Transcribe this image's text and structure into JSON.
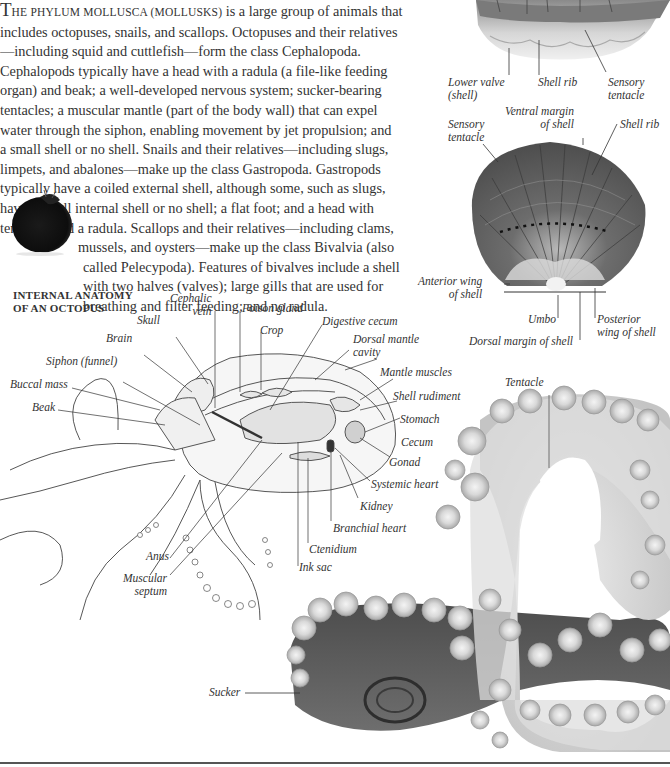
{
  "intro": {
    "lead_cap": "T",
    "lead_smallcaps": "HE PHYLUM MOLLUSCA (MOLLUSKS)",
    "lines": [
      " is a large group of animals that",
      "includes octopuses, snails, and scallops. Octopuses and their relatives",
      "—including squid and cuttlefish—form the class Cephalopoda.",
      "Cephalopods typically have a head with a radula (a file-like feeding",
      "organ) and beak; a well-developed nervous system; sucker-bearing",
      "tentacles; a muscular mantle (part of the body wall) that can expel",
      "water through the siphon, enabling movement by jet propulsion; and",
      "a small shell or no shell. Snails and their relatives—including slugs,",
      "limpets, and abalones—make up the class Gastropoda. Gastropods",
      "typically have a coiled external shell, although some, such as slugs,",
      "have a small internal shell or no shell; a flat foot; and a head with",
      "tentacles and a radula. Scallops and their relatives—including clams,"
    ],
    "indented_lines": [
      "mussels, and oysters—make up the class Bivalvia (also",
      "called Pelecypoda). Features of bivalves include a shell",
      "with two halves (valves); large gills that are used for",
      "breathing and filter feeding; and no radula."
    ]
  },
  "scallop_side": {
    "labels": [
      "Lower valve",
      "(shell)",
      "Shell rib",
      "Sensory",
      "tentacle"
    ]
  },
  "scallop_top": {
    "labels": {
      "ventral_margin_1": "Ventral margin",
      "ventral_margin_2": "of shell",
      "sensory_1": "Sensory",
      "sensory_2": "tentacle",
      "shell_rib": "Shell rib",
      "anterior_1": "Anterior wing",
      "anterior_2": "of shell",
      "umbo": "Umbo",
      "posterior_1": "Posterior",
      "posterior_2": "wing of shell",
      "dorsal_margin": "Dorsal margin of shell"
    }
  },
  "octopus_anatomy": {
    "heading_1": "INTERNAL ANATOMY",
    "heading_2": "OF AN OCTOPUS",
    "labels": {
      "cephalic_1": "Cephalic",
      "cephalic_2": "vein",
      "skull": "Skull",
      "poison_gland": "Poison gland",
      "crop": "Crop",
      "digestive_cecum": "Digestive cecum",
      "dorsal_mantle_1": "Dorsal mantle",
      "dorsal_mantle_2": "cavity",
      "brain": "Brain",
      "siphon": "Siphon (funnel)",
      "buccal_mass": "Buccal mass",
      "beak": "Beak",
      "mantle_muscles": "Mantle muscles",
      "shell_rudiment": "Shell rudiment",
      "stomach": "Stomach",
      "cecum": "Cecum",
      "gonad": "Gonad",
      "systemic_heart": "Systemic heart",
      "kidney": "Kidney",
      "branchial_heart": "Branchial heart",
      "ctenidium": "Ctenidium",
      "ink_sac": "Ink sac",
      "anus": "Anus",
      "muscular_1": "Muscular",
      "muscular_2": "septum"
    }
  },
  "tentacle_photo": {
    "tentacle": "Tentacle",
    "sucker": "Sucker"
  }
}
